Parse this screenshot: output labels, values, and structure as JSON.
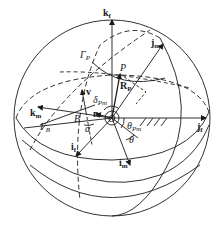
{
  "diagram": {
    "type": "spherical coordinate geometry",
    "colors": {
      "stroke": "#1a1a1a",
      "background": "#ffffff"
    },
    "labels": {
      "k_f": {
        "main": "k",
        "sub": "f"
      },
      "j_m": {
        "main": "j",
        "sub": "m"
      },
      "Gamma_P": {
        "main": "Γ",
        "sub": "P"
      },
      "P": {
        "main": "P"
      },
      "R_P": {
        "main": "R",
        "sub": "P"
      },
      "v": {
        "main": "v"
      },
      "delta_Pm": {
        "main": "δ",
        "sub": "Pm"
      },
      "k_m": {
        "main": "k",
        "sub": "m"
      },
      "n": {
        "main": "n"
      },
      "O": {
        "main": "O"
      },
      "B": {
        "main": "B"
      },
      "Gamma_B": {
        "main": "Γ",
        "sub": "B"
      },
      "alpha": {
        "main": "α"
      },
      "theta_Pm": {
        "main": "θ",
        "sub": "Pm"
      },
      "j_f": {
        "main": "j",
        "sub": "f"
      },
      "theta": {
        "main": "θ"
      },
      "i_f": {
        "main": "i",
        "sub": "f"
      },
      "i_m": {
        "main": "i",
        "sub": "m"
      }
    }
  }
}
